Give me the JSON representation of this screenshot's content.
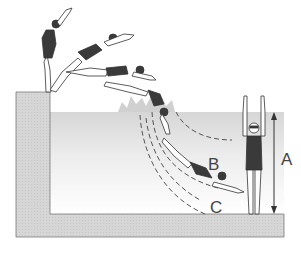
{
  "diagram": {
    "title": "",
    "labels": {
      "a": "A",
      "b": "B",
      "c": "C"
    },
    "elements": [
      {
        "name": "pool-wall-and-floor",
        "description": "L-shaped grey pool edge: starting block on left, floor along bottom"
      },
      {
        "name": "water",
        "description": "Water region with grey gradient fading to white at depth"
      },
      {
        "name": "diver-sequence",
        "description": "Swimmer shown in five stages of a racing dive from the block into water"
      },
      {
        "name": "standing-swimmer",
        "description": "Swimmer standing in pool with arms raised"
      },
      {
        "name": "depth-arrow",
        "description": "Double-headed vertical arrow labeled A showing depth from surface to floor"
      },
      {
        "name": "trajectory-curves",
        "description": "Dashed curves showing dive paths B and C"
      }
    ],
    "colors": {
      "wall_fill": "#d4d4d4",
      "wall_stroke": "#7a7a7a",
      "water_top": "#d9d9d9",
      "water_bottom": "#ffffff",
      "swimsuit": "#3a3a3a",
      "skin": "#ffffff",
      "line": "#333333"
    }
  }
}
